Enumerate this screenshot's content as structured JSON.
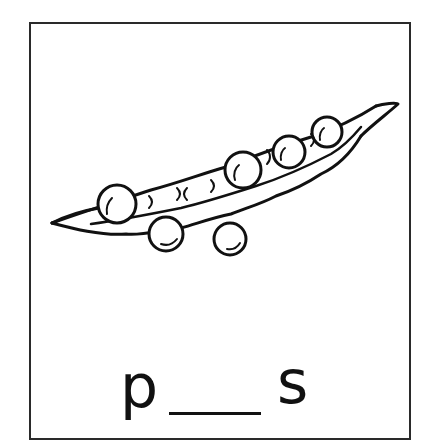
{
  "card": {
    "illustration": {
      "subject": "pea-pod",
      "description": "Open pea pod with peas inside and two loose peas below"
    },
    "word": {
      "first_letter": "p",
      "blank": "___",
      "last_letter": "s"
    }
  },
  "colors": {
    "ink": "#111111",
    "border": "#2a2a2a",
    "background": "#ffffff"
  }
}
